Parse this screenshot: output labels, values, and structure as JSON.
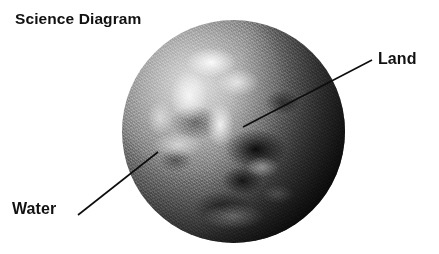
{
  "diagram": {
    "title": "Science Diagram",
    "background_color": "#ffffff",
    "text_color": "#111111",
    "image_style": "grayscale",
    "callouts": [
      {
        "id": "land",
        "label": "Land",
        "label_position": {
          "x": 378,
          "y": 50
        },
        "leader_line": {
          "x1": 372,
          "y1": 60,
          "x2": 243,
          "y2": 127
        },
        "line_color": "#0d0d0d"
      },
      {
        "id": "water",
        "label": "Water",
        "label_position": {
          "x": 12,
          "y": 200
        },
        "leader_line": {
          "x1": 78,
          "y1": 215,
          "x2": 158,
          "y2": 152
        },
        "line_color": "#0d0d0d"
      }
    ],
    "globe": {
      "name": "earth",
      "center": {
        "x": 233,
        "y": 131
      },
      "radius": 111,
      "bounds": {
        "left": 122,
        "top": 20,
        "width": 223,
        "height": 223
      }
    }
  }
}
